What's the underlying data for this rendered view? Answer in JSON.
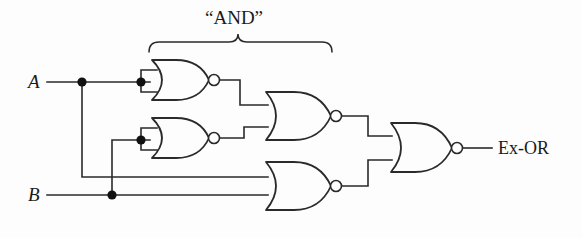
{
  "diagram": {
    "title_label": "“AND”",
    "background_color": "#fdfdfd",
    "line_color": "#2a2a2a",
    "inputs": [
      {
        "name": "input-a",
        "label": "A",
        "x": 30,
        "y": 82
      },
      {
        "name": "input-b",
        "label": "B",
        "x": 30,
        "y": 195
      }
    ],
    "output": {
      "name": "output-exor",
      "label": "Ex-OR",
      "x": 498,
      "y": 148
    },
    "brace": {
      "label": "“AND”",
      "left_x": 148,
      "right_x": 332,
      "apex_x": 238,
      "y": 40
    },
    "gates": [
      {
        "name": "nor-gate-1",
        "type": "NOR",
        "role": "inverter-a",
        "x": 150,
        "y": 60
      },
      {
        "name": "nor-gate-2",
        "type": "NOR",
        "role": "inverter-b",
        "x": 150,
        "y": 118
      },
      {
        "name": "nor-gate-3",
        "type": "NOR",
        "role": "and-upper",
        "x": 265,
        "y": 92
      },
      {
        "name": "nor-gate-4",
        "type": "NOR",
        "role": "and-lower",
        "x": 265,
        "y": 162
      },
      {
        "name": "nor-gate-5",
        "type": "NOR",
        "role": "output-combiner",
        "x": 390,
        "y": 123
      }
    ],
    "junctions": [
      {
        "name": "junction-a-branch",
        "x": 82,
        "y": 82
      },
      {
        "name": "junction-a-gate1",
        "x": 141,
        "y": 82
      },
      {
        "name": "junction-b-gate2",
        "x": 141,
        "y": 140
      },
      {
        "name": "junction-b-branch",
        "x": 112,
        "y": 195
      }
    ]
  }
}
